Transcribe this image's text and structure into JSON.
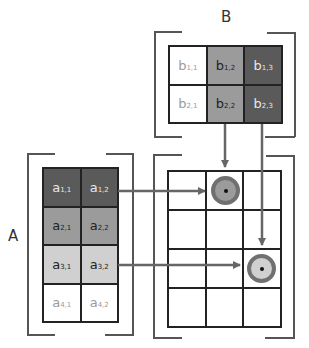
{
  "labels": {
    "matrix_a": "A",
    "matrix_b": "B"
  },
  "colors": {
    "dark": "#5a5a5a",
    "medium": "#9b9b9b",
    "light": "#d0d0d0",
    "white": "#ffffff",
    "arrow": "#666666",
    "ring": "#707070"
  },
  "matrix_b": {
    "rows": [
      [
        {
          "base": "b",
          "sub": "1,1",
          "shade": "white"
        },
        {
          "base": "b",
          "sub": "1,2",
          "shade": "medium"
        },
        {
          "base": "b",
          "sub": "1,3",
          "shade": "dark"
        }
      ],
      [
        {
          "base": "b",
          "sub": "2,1",
          "shade": "white"
        },
        {
          "base": "b",
          "sub": "2,2",
          "shade": "medium"
        },
        {
          "base": "b",
          "sub": "2,3",
          "shade": "dark"
        }
      ]
    ]
  },
  "matrix_a": {
    "rows": [
      [
        {
          "base": "a",
          "sub": "1,1",
          "shade": "dark"
        },
        {
          "base": "a",
          "sub": "1,2",
          "shade": "dark"
        }
      ],
      [
        {
          "base": "a",
          "sub": "2,1",
          "shade": "medium"
        },
        {
          "base": "a",
          "sub": "2,2",
          "shade": "medium"
        }
      ],
      [
        {
          "base": "a",
          "sub": "3,1",
          "shade": "light"
        },
        {
          "base": "a",
          "sub": "3,2",
          "shade": "light"
        }
      ],
      [
        {
          "base": "a",
          "sub": "4,1",
          "shade": "white"
        },
        {
          "base": "a",
          "sub": "4,2",
          "shade": "white"
        }
      ]
    ]
  },
  "result_grid": {
    "rows": 4,
    "cols": 3,
    "markers": [
      {
        "row": 1,
        "col": 2,
        "fill": "medium",
        "from_a_row": 1,
        "from_b_col": 2
      },
      {
        "row": 3,
        "col": 3,
        "fill": "light",
        "from_a_row": 3,
        "from_b_col": 3
      }
    ]
  }
}
